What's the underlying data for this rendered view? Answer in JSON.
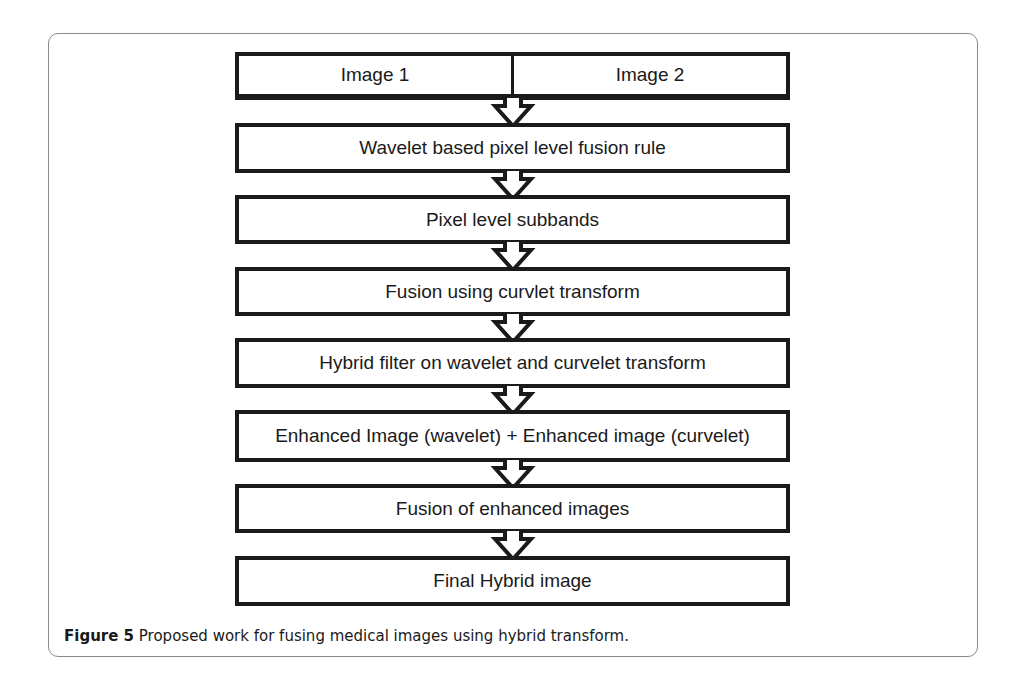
{
  "figure": {
    "inputs": [
      "Image 1",
      "Image 2"
    ],
    "steps": [
      "Wavelet based pixel level fusion rule",
      "Pixel level subbands",
      "Fusion using curvlet transform",
      "Hybrid filter on wavelet and curvelet transform",
      "Enhanced Image (wavelet) + Enhanced image (curvelet)",
      "Fusion of enhanced images",
      "Final Hybrid image"
    ],
    "arrow_icon": "down-arrow-icon"
  },
  "caption": {
    "label": "Figure 5",
    "text": " Proposed work for fusing medical images using hybrid transform."
  }
}
